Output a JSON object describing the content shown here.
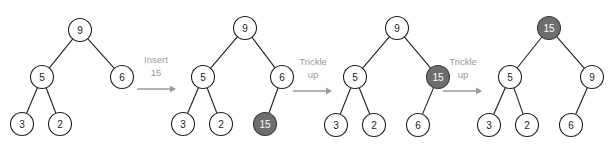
{
  "diagram": {
    "node_radius": 11.5,
    "colors": {
      "node_fill": "#ffffff",
      "node_stroke": "#231f20",
      "highlight_fill": "#6e6e6e",
      "highlight_stroke": "#3d3d3d",
      "highlight_text": "#ffffff",
      "edge": "#231f20",
      "label": "#9a9a9a",
      "background": "#ffffff"
    },
    "steps": [
      {
        "name": "insert-15",
        "lines": [
          "Insert",
          "15"
        ],
        "label_x": 156,
        "label_y": [
          63,
          76
        ],
        "arrow": {
          "x1": 137,
          "x2": 176,
          "y": 89
        }
      },
      {
        "name": "trickle-up-1",
        "lines": [
          "Trickle",
          "up"
        ],
        "label_x": 313,
        "label_y": [
          65,
          78
        ],
        "arrow": {
          "x1": 293,
          "x2": 332,
          "y": 91
        }
      },
      {
        "name": "trickle-up-2",
        "lines": [
          "Trickle",
          "up"
        ],
        "label_x": 463,
        "label_y": [
          65,
          78
        ],
        "arrow": {
          "x1": 443,
          "x2": 482,
          "y": 91
        }
      }
    ],
    "trees": [
      {
        "name": "tree-initial",
        "nodes": [
          {
            "id": "t1-9",
            "value": "9",
            "x": 80,
            "y": 30,
            "highlight": false
          },
          {
            "id": "t1-5",
            "value": "5",
            "x": 42,
            "y": 77,
            "highlight": false
          },
          {
            "id": "t1-6",
            "value": "6",
            "x": 122,
            "y": 77,
            "highlight": false
          },
          {
            "id": "t1-3",
            "value": "3",
            "x": 22,
            "y": 124,
            "highlight": false
          },
          {
            "id": "t1-2",
            "value": "2",
            "x": 60,
            "y": 124,
            "highlight": false
          }
        ],
        "edges": [
          {
            "from": "t1-9",
            "to": "t1-5"
          },
          {
            "from": "t1-9",
            "to": "t1-6"
          },
          {
            "from": "t1-5",
            "to": "t1-3"
          },
          {
            "from": "t1-5",
            "to": "t1-2"
          }
        ]
      },
      {
        "name": "tree-after-insert",
        "nodes": [
          {
            "id": "t2-9",
            "value": "9",
            "x": 245,
            "y": 28,
            "highlight": false
          },
          {
            "id": "t2-5",
            "value": "5",
            "x": 203,
            "y": 77,
            "highlight": false
          },
          {
            "id": "t2-6",
            "value": "6",
            "x": 282,
            "y": 77,
            "highlight": false
          },
          {
            "id": "t2-3",
            "value": "3",
            "x": 183,
            "y": 124,
            "highlight": false
          },
          {
            "id": "t2-2",
            "value": "2",
            "x": 221,
            "y": 124,
            "highlight": false
          },
          {
            "id": "t2-15",
            "value": "15",
            "x": 265,
            "y": 124,
            "highlight": true
          }
        ],
        "edges": [
          {
            "from": "t2-9",
            "to": "t2-5"
          },
          {
            "from": "t2-9",
            "to": "t2-6"
          },
          {
            "from": "t2-5",
            "to": "t2-3"
          },
          {
            "from": "t2-5",
            "to": "t2-2"
          },
          {
            "from": "t2-6",
            "to": "t2-15"
          }
        ]
      },
      {
        "name": "tree-after-trickle-1",
        "nodes": [
          {
            "id": "t3-9",
            "value": "9",
            "x": 397,
            "y": 28,
            "highlight": false
          },
          {
            "id": "t3-5",
            "value": "5",
            "x": 355,
            "y": 77,
            "highlight": false
          },
          {
            "id": "t3-15",
            "value": "15",
            "x": 438,
            "y": 77,
            "highlight": true
          },
          {
            "id": "t3-3",
            "value": "3",
            "x": 336,
            "y": 125,
            "highlight": false
          },
          {
            "id": "t3-2",
            "value": "2",
            "x": 374,
            "y": 125,
            "highlight": false
          },
          {
            "id": "t3-6",
            "value": "6",
            "x": 418,
            "y": 125,
            "highlight": false
          }
        ],
        "edges": [
          {
            "from": "t3-9",
            "to": "t3-5"
          },
          {
            "from": "t3-9",
            "to": "t3-15"
          },
          {
            "from": "t3-5",
            "to": "t3-3"
          },
          {
            "from": "t3-5",
            "to": "t3-2"
          },
          {
            "from": "t3-15",
            "to": "t3-6"
          }
        ]
      },
      {
        "name": "tree-after-trickle-2",
        "nodes": [
          {
            "id": "t4-15",
            "value": "15",
            "x": 549,
            "y": 28,
            "highlight": true
          },
          {
            "id": "t4-5",
            "value": "5",
            "x": 510,
            "y": 77,
            "highlight": false
          },
          {
            "id": "t4-9",
            "value": "9",
            "x": 592,
            "y": 77,
            "highlight": false
          },
          {
            "id": "t4-3",
            "value": "3",
            "x": 489,
            "y": 125,
            "highlight": false
          },
          {
            "id": "t4-2",
            "value": "2",
            "x": 527,
            "y": 125,
            "highlight": false
          },
          {
            "id": "t4-6",
            "value": "6",
            "x": 571,
            "y": 125,
            "highlight": false
          }
        ],
        "edges": [
          {
            "from": "t4-15",
            "to": "t4-5"
          },
          {
            "from": "t4-15",
            "to": "t4-9"
          },
          {
            "from": "t4-5",
            "to": "t4-3"
          },
          {
            "from": "t4-5",
            "to": "t4-2"
          },
          {
            "from": "t4-9",
            "to": "t4-6"
          }
        ]
      }
    ]
  }
}
